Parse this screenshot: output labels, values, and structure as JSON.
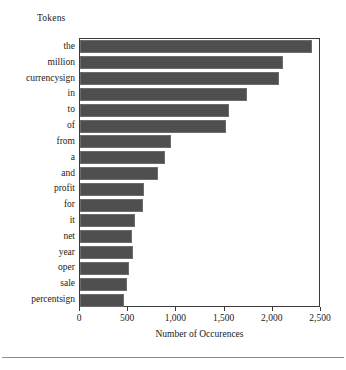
{
  "figure": {
    "background_color": "#ffffff",
    "frame_color": "#3a3a3a",
    "bar_color": "#4f4f4f",
    "bar_edge_color": "#6d6d6d",
    "bottom_rule_color": "#8d8d8d"
  },
  "chart_data": {
    "type": "bar",
    "orientation": "horizontal",
    "title": "",
    "group_title": "Tokens",
    "xlabel": "Number of Occurences",
    "ylabel": "Tokens",
    "grid": false,
    "legend": null,
    "xlim": [
      0,
      2500
    ],
    "xticks": [
      0,
      500,
      1000,
      1500,
      2000,
      2500
    ],
    "xticklabels": [
      "0",
      "500",
      "1,000",
      "1,500",
      "2,000",
      "2,500"
    ],
    "categories": [
      "the",
      "million",
      "currencysign",
      "in",
      "to",
      "of",
      "from",
      "a",
      "and",
      "profit",
      "for",
      "it",
      "net",
      "year",
      "oper",
      "sale",
      "percentsign"
    ],
    "values": [
      2410,
      2110,
      2060,
      1730,
      1550,
      1515,
      945,
      885,
      805,
      665,
      650,
      570,
      540,
      545,
      510,
      485,
      460
    ]
  }
}
